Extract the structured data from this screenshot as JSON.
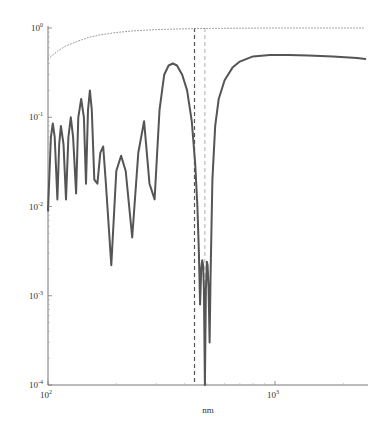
{
  "chart_data": {
    "type": "line",
    "title": "",
    "xlabel": "nm",
    "ylabel": "",
    "xscale": "log",
    "yscale": "log",
    "xlim": [
      100,
      2500
    ],
    "ylim": [
      0.0001,
      1
    ],
    "grid": false,
    "legend": null,
    "x_ticks": [
      {
        "base": "10",
        "exp": "2",
        "value": 100
      },
      {
        "base": "10",
        "exp": "3",
        "value": 1000
      }
    ],
    "y_ticks": [
      {
        "base": "10",
        "exp": "0",
        "value": 1
      },
      {
        "base": "10",
        "exp": "-1",
        "value": 0.1
      },
      {
        "base": "10",
        "exp": "-2",
        "value": 0.01
      },
      {
        "base": "10",
        "exp": "-3",
        "value": 0.001
      },
      {
        "base": "10",
        "exp": "-4",
        "value": 0.0001
      }
    ],
    "series": [
      {
        "name": "reflectance (solid)",
        "style": "solid",
        "color": "#555555",
        "x": [
          100,
          103,
          105,
          107,
          110,
          112,
          114,
          117,
          120,
          123,
          126,
          129,
          133,
          136,
          140,
          144,
          147,
          150,
          153,
          156,
          160,
          165,
          170,
          175,
          180,
          190,
          200,
          210,
          220,
          235,
          250,
          265,
          280,
          295,
          310,
          325,
          340,
          355,
          370,
          390,
          410,
          430,
          445,
          455,
          462,
          468,
          473,
          478,
          482,
          486,
          491,
          496,
          501,
          505,
          510,
          515,
          520,
          530,
          545,
          565,
          600,
          650,
          700,
          800,
          950,
          1150,
          1400,
          1800,
          2300,
          2500
        ],
        "y": [
          0.009,
          0.06,
          0.085,
          0.06,
          0.012,
          0.05,
          0.08,
          0.05,
          0.012,
          0.06,
          0.1,
          0.06,
          0.014,
          0.1,
          0.16,
          0.1,
          0.018,
          0.12,
          0.2,
          0.12,
          0.02,
          0.018,
          0.04,
          0.047,
          0.018,
          0.0022,
          0.025,
          0.037,
          0.025,
          0.0045,
          0.04,
          0.09,
          0.018,
          0.012,
          0.12,
          0.3,
          0.38,
          0.4,
          0.38,
          0.3,
          0.2,
          0.09,
          0.03,
          0.01,
          0.003,
          0.0008,
          0.002,
          0.0025,
          0.0022,
          0.0012,
          0.0001,
          0.0012,
          0.0024,
          0.0022,
          0.0012,
          0.0003,
          0.0015,
          0.02,
          0.08,
          0.16,
          0.26,
          0.36,
          0.42,
          0.48,
          0.5,
          0.5,
          0.49,
          0.48,
          0.46,
          0.45
        ]
      },
      {
        "name": "upper bound (dotted)",
        "style": "dotted",
        "color": "#999999",
        "x": [
          100,
          110,
          120,
          135,
          150,
          170,
          200,
          240,
          300,
          400,
          500,
          700,
          1000,
          1500,
          2500
        ],
        "y": [
          0.45,
          0.55,
          0.63,
          0.71,
          0.78,
          0.84,
          0.89,
          0.93,
          0.96,
          0.98,
          0.99,
          0.995,
          1.0,
          1.0,
          1.0
        ]
      }
    ],
    "vertical_markers": [
      {
        "x": 442,
        "style": "dashed",
        "color": "#555555"
      },
      {
        "x": 491,
        "style": "dashed",
        "color": "#bbbbbb"
      }
    ]
  }
}
